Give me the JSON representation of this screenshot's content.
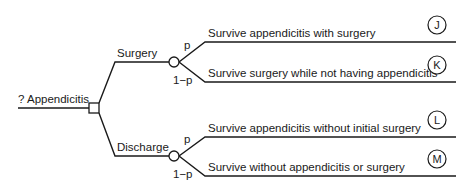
{
  "tree": {
    "root_label": "? Appendicitis",
    "decision_node": "decision-square",
    "branches": [
      {
        "label": "Surgery",
        "chance_node": "chance-circle",
        "outcomes": [
          {
            "prob": "p",
            "text": "Survive appendicitis with surgery",
            "marker": "J"
          },
          {
            "prob": "1−p",
            "text": "Survive surgery while not having appendicitis",
            "marker": "K"
          }
        ]
      },
      {
        "label": "Discharge",
        "chance_node": "chance-circle",
        "outcomes": [
          {
            "prob": "p",
            "text": "Survive appendicitis without initial surgery",
            "marker": "L"
          },
          {
            "prob": "1−p",
            "text": "Survive without appendicitis or surgery",
            "marker": "M"
          }
        ]
      }
    ]
  }
}
